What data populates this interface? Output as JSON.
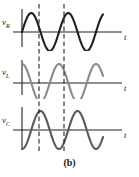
{
  "figure": {
    "caption": "(b)",
    "width": 139,
    "height": 177,
    "background": "#ffffff"
  },
  "plots": [
    {
      "id": "vr",
      "label_main": "v",
      "label_sub": "R",
      "axis_label": "t",
      "curve_color": "#231f20",
      "axis_color": "#231f20",
      "phase_deg": 0,
      "label_x": 2,
      "label_y": 18,
      "t_x": 124,
      "t_y": 33,
      "baseline_y": 32,
      "top": 0
    },
    {
      "id": "vl",
      "label_main": "v",
      "label_sub": "L",
      "axis_label": "t",
      "curve_color": "#8a8a8a",
      "axis_color": "#231f20",
      "phase_deg": 90,
      "label_x": 2,
      "label_y": 68,
      "t_x": 124,
      "t_y": 84,
      "baseline_y": 83,
      "top": 51
    },
    {
      "id": "vc",
      "label_main": "v",
      "label_sub": "C",
      "axis_label": "t",
      "curve_color": "#595959",
      "axis_color": "#231f20",
      "phase_deg": -90,
      "label_x": 2,
      "label_y": 116,
      "t_x": 124,
      "t_y": 131,
      "baseline_y": 130,
      "top": 99
    }
  ],
  "dashed_lines": [
    {
      "name": "marker-line-1",
      "x": 39,
      "y_top": 4,
      "y_bottom": 152,
      "color": "#231f20"
    },
    {
      "name": "marker-line-2",
      "x": 64,
      "y_top": 4,
      "y_bottom": 152,
      "color": "#231f20"
    }
  ],
  "chart_data": {
    "type": "line",
    "title": "(b)",
    "xlabel": "t",
    "ylabel": "",
    "grid": false,
    "legend": "none",
    "xlim": [
      0,
      2.35
    ],
    "ylim": [
      -1.15,
      1.15
    ],
    "annotations": [
      {
        "type": "vertical-dashed-line",
        "x": 0.3,
        "label": ""
      },
      {
        "type": "vertical-dashed-line",
        "x": 0.8,
        "label": ""
      }
    ],
    "series": [
      {
        "name": "v_R",
        "color": "#231f20",
        "form": "sin",
        "amplitude": 1.0,
        "phase_deg": 0,
        "cycles": 2.2,
        "description": "Resistor voltage, in phase with current"
      },
      {
        "name": "v_L",
        "color": "#8a8a8a",
        "form": "sin",
        "amplitude": 1.0,
        "phase_deg": 90,
        "cycles": 2.2,
        "description": "Inductor voltage, leads current by 90 degrees"
      },
      {
        "name": "v_C",
        "color": "#595959",
        "form": "sin",
        "amplitude": 1.0,
        "phase_deg": -90,
        "cycles": 2.2,
        "description": "Capacitor voltage, lags current by 90 degrees"
      }
    ]
  }
}
